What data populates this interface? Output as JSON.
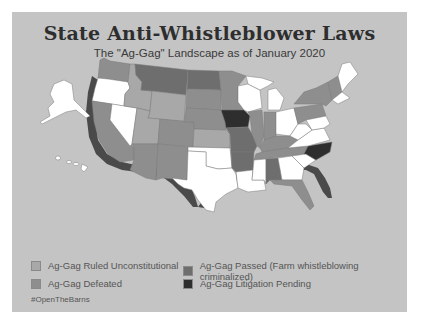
{
  "header": {
    "title": "State Anti-Whistleblower Laws",
    "subtitle": "The \"Ag-Gag\" Landscape as of January 2020"
  },
  "colors": {
    "background": "#c4c4c4",
    "no_law": "#ffffff",
    "ruled_unconstitutional": "#a8a8a8",
    "defeated": "#8e8e8e",
    "passed": "#6e6e6e",
    "litigation_pending": "#2e2e2e",
    "coast_shadow": "#4a4a4a"
  },
  "legend": {
    "items": [
      {
        "label": "Ag-Gag Ruled Unconstitutional",
        "color": "#a8a8a8"
      },
      {
        "label": "Ag-Gag Passed (Farm whistleblowing criminalized)",
        "color": "#6e6e6e"
      },
      {
        "label": "Ag-Gag Defeated",
        "color": "#8e8e8e"
      },
      {
        "label": "Ag-Gag Litigation Pending",
        "color": "#2e2e2e"
      }
    ]
  },
  "footer": {
    "hashtag": "#OpenTheBarns"
  },
  "map": {
    "states": [
      {
        "name": "Washington",
        "category": "defeated"
      },
      {
        "name": "Oregon",
        "category": "no_law"
      },
      {
        "name": "California",
        "category": "defeated"
      },
      {
        "name": "Nevada",
        "category": "no_law"
      },
      {
        "name": "Idaho",
        "category": "ruled_unconstitutional"
      },
      {
        "name": "Montana",
        "category": "passed"
      },
      {
        "name": "Wyoming",
        "category": "ruled_unconstitutional"
      },
      {
        "name": "Utah",
        "category": "ruled_unconstitutional"
      },
      {
        "name": "Arizona",
        "category": "defeated"
      },
      {
        "name": "Colorado",
        "category": "defeated"
      },
      {
        "name": "New Mexico",
        "category": "defeated"
      },
      {
        "name": "North Dakota",
        "category": "passed"
      },
      {
        "name": "South Dakota",
        "category": "defeated"
      },
      {
        "name": "Nebraska",
        "category": "defeated"
      },
      {
        "name": "Kansas",
        "category": "ruled_unconstitutional"
      },
      {
        "name": "Oklahoma",
        "category": "no_law"
      },
      {
        "name": "Texas",
        "category": "no_law"
      },
      {
        "name": "Minnesota",
        "category": "defeated"
      },
      {
        "name": "Iowa",
        "category": "litigation_pending"
      },
      {
        "name": "Missouri",
        "category": "passed"
      },
      {
        "name": "Arkansas",
        "category": "passed"
      },
      {
        "name": "Louisiana",
        "category": "no_law"
      },
      {
        "name": "Wisconsin",
        "category": "no_law"
      },
      {
        "name": "Illinois",
        "category": "defeated"
      },
      {
        "name": "Michigan",
        "category": "no_law"
      },
      {
        "name": "Indiana",
        "category": "defeated"
      },
      {
        "name": "Ohio",
        "category": "no_law"
      },
      {
        "name": "Kentucky",
        "category": "defeated"
      },
      {
        "name": "Tennessee",
        "category": "defeated"
      },
      {
        "name": "Mississippi",
        "category": "no_law"
      },
      {
        "name": "Alabama",
        "category": "passed"
      },
      {
        "name": "Georgia",
        "category": "no_law"
      },
      {
        "name": "Florida",
        "category": "defeated"
      },
      {
        "name": "South Carolina",
        "category": "no_law"
      },
      {
        "name": "North Carolina",
        "category": "litigation_pending"
      },
      {
        "name": "Virginia",
        "category": "no_law"
      },
      {
        "name": "West Virginia",
        "category": "no_law"
      },
      {
        "name": "Pennsylvania",
        "category": "defeated"
      },
      {
        "name": "New York",
        "category": "defeated"
      },
      {
        "name": "Vermont",
        "category": "defeated"
      },
      {
        "name": "New Hampshire",
        "category": "defeated"
      },
      {
        "name": "Maine",
        "category": "no_law"
      },
      {
        "name": "Alaska",
        "category": "no_law"
      },
      {
        "name": "Hawaii",
        "category": "no_law"
      }
    ]
  }
}
